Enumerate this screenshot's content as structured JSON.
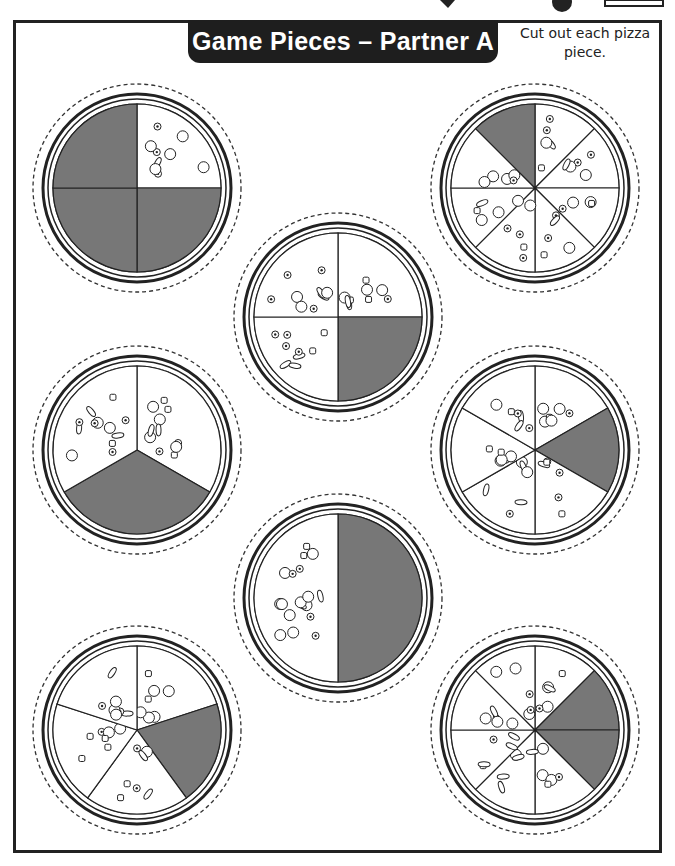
{
  "header": {
    "title": "Game Pieces – Partner A",
    "instructions": "Cut out each pizza piece."
  },
  "colors": {
    "shaded": "#777777",
    "outline": "#222222",
    "banner": "#1e1e1e"
  },
  "pizzas": [
    {
      "id": "pizza-1",
      "cx": 137,
      "cy": 188,
      "slices": 4,
      "shaded": [
        1,
        2,
        3
      ],
      "start_angle": -90,
      "label": "4 slices, 3 shaded"
    },
    {
      "id": "pizza-2",
      "cx": 535,
      "cy": 188,
      "slices": 8,
      "shaded": [
        7
      ],
      "start_angle": -90,
      "label": "8 slices, 1 shaded"
    },
    {
      "id": "pizza-3",
      "cx": 338,
      "cy": 317,
      "slices": 4,
      "shaded": [
        1
      ],
      "start_angle": -90,
      "label": "4 slices, 1 shaded"
    },
    {
      "id": "pizza-4",
      "cx": 137,
      "cy": 450,
      "slices": 3,
      "shaded": [
        1
      ],
      "start_angle": -90,
      "label": "3 slices, 1 shaded"
    },
    {
      "id": "pizza-5",
      "cx": 535,
      "cy": 450,
      "slices": 6,
      "shaded": [
        1
      ],
      "start_angle": -90,
      "label": "6 slices, 1 shaded"
    },
    {
      "id": "pizza-6",
      "cx": 338,
      "cy": 598,
      "slices": 2,
      "shaded": [
        0
      ],
      "start_angle": -90,
      "label": "2 slices, 1 shaded"
    },
    {
      "id": "pizza-7",
      "cx": 137,
      "cy": 730,
      "slices": 5,
      "shaded": [
        1
      ],
      "start_angle": -90,
      "label": "5 slices, 1 shaded"
    },
    {
      "id": "pizza-8",
      "cx": 535,
      "cy": 730,
      "slices": 8,
      "shaded": [
        1,
        2
      ],
      "start_angle": -90,
      "label": "8 slices, 2 shaded"
    }
  ]
}
